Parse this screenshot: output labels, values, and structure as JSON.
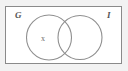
{
  "figure": {
    "type": "venn-diagram",
    "title": "",
    "universe": {
      "label": "",
      "shape": "rectangle",
      "border_color": "#8a8a8a",
      "fill_color": "#ffffff"
    },
    "page_background": "#f2f2f2",
    "sets": [
      {
        "id": "G",
        "label": "G",
        "label_position": "top-left-outside-circle",
        "circle": {
          "cx": 49,
          "cy": 37.5,
          "r": 22.5
        },
        "stroke_color": "#8f8f8f"
      },
      {
        "id": "I",
        "label": "I",
        "label_position": "top-right-outside-circle",
        "circle": {
          "cx": 80,
          "cy": 37.5,
          "r": 22.0
        },
        "stroke_color": "#8f8f8f"
      }
    ],
    "elements": [
      {
        "label": "x",
        "region": "G-only",
        "x": 44,
        "y": 38
      }
    ]
  }
}
